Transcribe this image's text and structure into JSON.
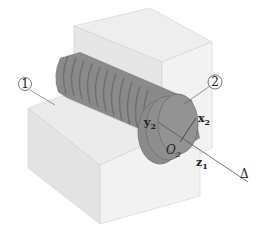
{
  "diagram": {
    "part_labels": [
      {
        "id": "1",
        "text": "1"
      },
      {
        "id": "2",
        "text": "2"
      }
    ],
    "axis_label": "Δ",
    "origin_label": {
      "main": "O",
      "sub": "2"
    },
    "vectors": [
      {
        "main": "x",
        "sub": "2"
      },
      {
        "main": "y",
        "sub": "2"
      },
      {
        "main": "z",
        "sub": "1"
      }
    ],
    "colors": {
      "block_front": "#e3e3e3",
      "block_top": "#eeeeee",
      "block_side": "#f3f3f3",
      "screw": "#8a8a8a",
      "screw_dark": "#6e6e6e",
      "line": "#555555"
    }
  }
}
